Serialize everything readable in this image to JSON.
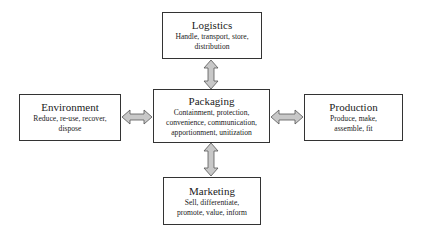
{
  "diagram": {
    "center": {
      "title": "Packaging",
      "desc_lines": [
        "Containment, protection,",
        "convenience, communication,",
        "apportionment, unitization"
      ]
    },
    "top": {
      "title": "Logistics",
      "desc_lines": [
        "Handle, transport, store,",
        "distribution"
      ]
    },
    "left": {
      "title": "Environment",
      "desc_lines": [
        "Reduce, re-use, recover,",
        "dispose"
      ]
    },
    "right": {
      "title": "Production",
      "desc_lines": [
        "Produce, make,",
        "assemble, fit"
      ]
    },
    "bottom": {
      "title": "Marketing",
      "desc_lines": [
        "Sell, differentiate,",
        "promote, value, inform"
      ]
    },
    "colors": {
      "arrow_fill": "#c8c8c8",
      "arrow_stroke": "#555555",
      "border": "#333333"
    }
  }
}
